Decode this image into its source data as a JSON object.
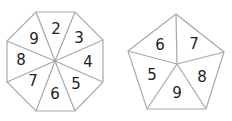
{
  "spinners": [
    {
      "shape": "octagon",
      "sections": 8,
      "numbers": [
        "2",
        "3",
        "4",
        "5",
        "6",
        "7",
        "8",
        "9"
      ]
    },
    {
      "shape": "pentagon",
      "sections": 5,
      "numbers": [
        "7",
        "8",
        "9",
        "5",
        "6"
      ]
    }
  ],
  "colors": {
    "edge": "#a8a8a8",
    "text": "#222222",
    "background": "#ffffff"
  }
}
